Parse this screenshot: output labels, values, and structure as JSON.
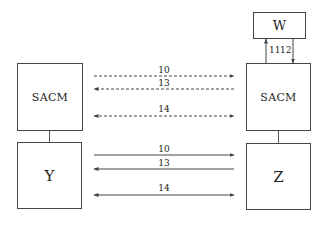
{
  "left": {
    "top_box": {
      "label": "SACM"
    },
    "bottom_box": {
      "label": "Y"
    }
  },
  "right": {
    "top_box": {
      "label": "W"
    },
    "middle_box": {
      "label": "SACM"
    },
    "bottom_box": {
      "label": "Z"
    }
  },
  "vertical_arrows": [
    {
      "label": "11",
      "direction": "up"
    },
    {
      "label": "12",
      "direction": "down"
    }
  ],
  "dashed_arrows": [
    {
      "label": "10",
      "direction": "right"
    },
    {
      "label": "13",
      "direction": "left"
    },
    {
      "label": "14",
      "direction": "both"
    }
  ],
  "solid_arrows": [
    {
      "label": "10",
      "direction": "right"
    },
    {
      "label": "13",
      "direction": "left"
    },
    {
      "label": "14",
      "direction": "both"
    }
  ],
  "colors": {
    "line": "#444444",
    "background": "#ffffff"
  }
}
